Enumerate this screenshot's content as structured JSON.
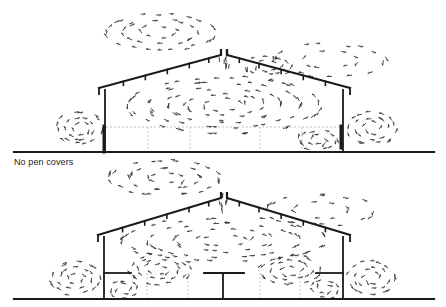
{
  "figure": {
    "caption": "No pen covers",
    "colors": {
      "structure": "#1a1a1a",
      "arrows": "#333333",
      "dashed": "#9a9a9a",
      "background": "#ffffff"
    },
    "panels": [
      {
        "id": "top",
        "description": "Building cross-section airflow, no pen covers",
        "ground": {
          "y": 152,
          "x1": 14,
          "x2": 434
        },
        "walls": {
          "left_x": 105,
          "right_x": 343,
          "eave_y": 90
        },
        "ridge": {
          "x": 224,
          "y": 50
        },
        "eaves": {
          "left_x": 99,
          "right_x": 350
        },
        "rafters_left": [
          0.2,
          0.38,
          0.56,
          0.74,
          0.9
        ],
        "rafters_right": [
          0.1,
          0.26,
          0.44,
          0.62,
          0.8
        ],
        "dashed_h": {
          "y": 127,
          "x1": 106,
          "x2": 342
        },
        "dashed_v": [
          148,
          190,
          260,
          302
        ],
        "wall_blocks": [
          {
            "x": 104,
            "y1": 126,
            "y2": 152
          },
          {
            "x": 341,
            "y1": 126,
            "y2": 148
          }
        ],
        "pen_covers": [],
        "vortices": [
          {
            "cx": 224,
            "cy": 105,
            "rx": 95,
            "ry": 28,
            "dir": -1,
            "rings": 5,
            "count": 34
          },
          {
            "cx": 160,
            "cy": 32,
            "rx": 55,
            "ry": 18,
            "dir": 1,
            "rings": 3,
            "count": 22
          },
          {
            "cx": 268,
            "cy": 66,
            "rx": 22,
            "ry": 9,
            "dir": -1,
            "rings": 2,
            "count": 12
          },
          {
            "cx": 318,
            "cy": 140,
            "rx": 18,
            "ry": 9,
            "dir": 1,
            "rings": 2,
            "count": 12
          },
          {
            "cx": 80,
            "cy": 128,
            "rx": 22,
            "ry": 16,
            "dir": 1,
            "rings": 3,
            "count": 14
          },
          {
            "cx": 372,
            "cy": 128,
            "rx": 24,
            "ry": 16,
            "dir": -1,
            "rings": 3,
            "count": 14
          },
          {
            "cx": 330,
            "cy": 60,
            "rx": 55,
            "ry": 16,
            "dir": 1,
            "rings": 2,
            "count": 16
          }
        ]
      },
      {
        "id": "bottom",
        "description": "Building cross-section airflow, with pen covers",
        "ground": {
          "y": 299,
          "x1": 14,
          "x2": 434
        },
        "walls": {
          "left_x": 104,
          "right_x": 343,
          "eave_y": 237
        },
        "ridge": {
          "x": 224,
          "y": 193
        },
        "eaves": {
          "left_x": 98,
          "right_x": 350
        },
        "rafters_left": [
          0.2,
          0.38,
          0.56,
          0.74,
          0.9
        ],
        "rafters_right": [
          0.1,
          0.26,
          0.44,
          0.62,
          0.8
        ],
        "dashed_h": null,
        "dashed_v": [
          147,
          188,
          260,
          300
        ],
        "wall_blocks": [],
        "pen_covers": [
          {
            "x1": 104,
            "x2": 131,
            "y": 273,
            "stem_x": null
          },
          {
            "x1": 204,
            "x2": 244,
            "y": 273,
            "stem_x": 223
          },
          {
            "x1": 316,
            "x2": 343,
            "y": 273,
            "stem_x": null
          }
        ],
        "vortices": [
          {
            "cx": 224,
            "cy": 240,
            "rx": 100,
            "ry": 22,
            "dir": -1,
            "rings": 4,
            "count": 32
          },
          {
            "cx": 160,
            "cy": 270,
            "rx": 30,
            "ry": 14,
            "dir": 1,
            "rings": 3,
            "count": 16
          },
          {
            "cx": 290,
            "cy": 270,
            "rx": 30,
            "ry": 14,
            "dir": -1,
            "rings": 3,
            "count": 16
          },
          {
            "cx": 165,
            "cy": 178,
            "rx": 55,
            "ry": 17,
            "dir": 1,
            "rings": 3,
            "count": 22
          },
          {
            "cx": 75,
            "cy": 278,
            "rx": 24,
            "ry": 16,
            "dir": 1,
            "rings": 3,
            "count": 14
          },
          {
            "cx": 372,
            "cy": 278,
            "rx": 24,
            "ry": 16,
            "dir": -1,
            "rings": 3,
            "count": 14
          },
          {
            "cx": 320,
            "cy": 210,
            "rx": 55,
            "ry": 15,
            "dir": 1,
            "rings": 2,
            "count": 16
          },
          {
            "cx": 124,
            "cy": 289,
            "rx": 14,
            "ry": 8,
            "dir": -1,
            "rings": 2,
            "count": 8
          },
          {
            "cx": 325,
            "cy": 289,
            "rx": 14,
            "ry": 8,
            "dir": 1,
            "rings": 2,
            "count": 8
          }
        ]
      }
    ]
  }
}
